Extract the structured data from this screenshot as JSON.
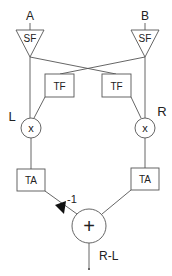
{
  "diagram": {
    "inputs": {
      "a": "A",
      "b": "B"
    },
    "sf_blocks": {
      "left": "SF",
      "right": "SF"
    },
    "tf_blocks": {
      "left": "TF",
      "right": "TF"
    },
    "channel_labels": {
      "left": "L",
      "right": "R"
    },
    "multipliers": {
      "left": "x",
      "right": "x"
    },
    "ta_blocks": {
      "left": "TA",
      "right": "TA"
    },
    "gain_label": "-1",
    "summer": "+",
    "output": "R-L",
    "colors": {
      "stroke": "#555555",
      "text": "#222222",
      "background": "#ffffff"
    }
  }
}
